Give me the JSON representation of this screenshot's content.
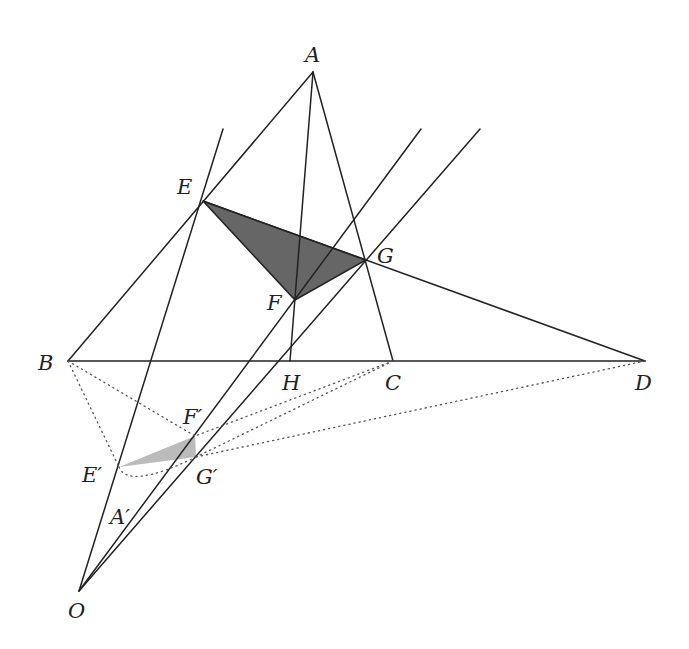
{
  "diagram": {
    "type": "geometry-projection",
    "points": {
      "A": {
        "label": "A",
        "x": 313,
        "y": 72,
        "lx": 305,
        "ly": 62
      },
      "B": {
        "label": "B",
        "x": 68,
        "y": 361,
        "lx": 38,
        "ly": 370
      },
      "C": {
        "label": "C",
        "x": 393,
        "y": 361,
        "lx": 385,
        "ly": 390
      },
      "D": {
        "label": "D",
        "x": 645,
        "y": 361,
        "lx": 635,
        "ly": 390
      },
      "E": {
        "label": "E",
        "x": 203,
        "y": 201,
        "lx": 177,
        "ly": 194
      },
      "F": {
        "label": "F",
        "x": 295,
        "y": 300,
        "lx": 267,
        "ly": 310
      },
      "G": {
        "label": "G",
        "x": 366,
        "y": 260,
        "lx": 377,
        "ly": 263
      },
      "H": {
        "label": "H",
        "x": 290,
        "y": 361,
        "lx": 282,
        "ly": 390
      },
      "O": {
        "label": "O",
        "x": 79,
        "y": 591,
        "lx": 68,
        "ly": 618
      },
      "E'": {
        "label": "E′",
        "x": 119,
        "y": 467,
        "lx": 82,
        "ly": 482
      },
      "F'": {
        "label": "F′",
        "x": 195,
        "y": 436,
        "lx": 183,
        "ly": 424
      },
      "G'": {
        "label": "G′",
        "x": 196,
        "y": 457,
        "lx": 196,
        "ly": 484
      },
      "A'": {
        "label": "A′",
        "x": 128,
        "y": 520,
        "lx": 110,
        "ly": 524
      }
    },
    "shaded_triangles": [
      {
        "name": "triangle-EFG",
        "vertices": [
          "E",
          "F",
          "G"
        ],
        "color": "#666666"
      },
      {
        "name": "triangle-E'F'G'",
        "vertices": [
          "E'",
          "F'",
          "G'"
        ],
        "color": "#bbbbbb"
      }
    ],
    "colors": {
      "line": "#222222",
      "dotted": "#555555",
      "dark_fill": "#666666",
      "light_fill": "#bbbbbb"
    }
  }
}
